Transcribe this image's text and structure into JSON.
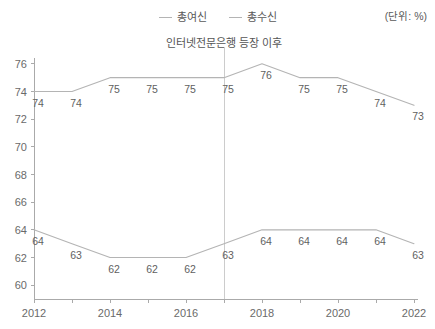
{
  "legend": {
    "entries": [
      {
        "label": "총여신",
        "icon": "line-swatch-icon"
      },
      {
        "label": "총수신",
        "icon": "line-swatch-icon"
      }
    ]
  },
  "unit_note": "(단위: %)",
  "annotation": {
    "text": "인터넷전문은행 등장 이후",
    "at_x": 2017
  },
  "chart_data": {
    "type": "line",
    "title": "인터넷전문은행 등장 이후",
    "xlabel": "",
    "ylabel": "",
    "unit": "(단위: %)",
    "x": [
      2012,
      2013,
      2014,
      2015,
      2016,
      2017,
      2018,
      2019,
      2020,
      2021,
      2022
    ],
    "xticklabels": [
      "2012",
      "",
      "2014",
      "",
      "2016",
      "",
      "2018",
      "",
      "2020",
      "",
      "2022"
    ],
    "xlim": [
      2012,
      2022
    ],
    "ylim": [
      59,
      77
    ],
    "yticks": [
      60,
      62,
      64,
      66,
      68,
      70,
      72,
      74,
      76
    ],
    "yticklabels": [
      "60",
      "62",
      "64",
      "66",
      "68",
      "70",
      "72",
      "74",
      "76"
    ],
    "grid": false,
    "legend_position": "top-center",
    "series": [
      {
        "name": "총여신",
        "color": "#b4b4b4",
        "values": [
          74,
          74,
          75,
          75,
          75,
          75,
          76,
          75,
          75,
          74,
          73
        ],
        "labels": [
          "74",
          "74",
          "75",
          "75",
          "75",
          "75",
          "76",
          "75",
          "75",
          "74",
          "73"
        ]
      },
      {
        "name": "총수신",
        "color": "#b4b4b4",
        "values": [
          64,
          63,
          62,
          62,
          62,
          63,
          64,
          64,
          64,
          64,
          63
        ],
        "labels": [
          "64",
          "63",
          "62",
          "62",
          "62",
          "63",
          "64",
          "64",
          "64",
          "64",
          "63"
        ]
      }
    ],
    "annotations": [
      {
        "type": "vline",
        "x": 2017,
        "text": "인터넷전문은행 등장 이후",
        "color": "#cccccc"
      }
    ]
  }
}
